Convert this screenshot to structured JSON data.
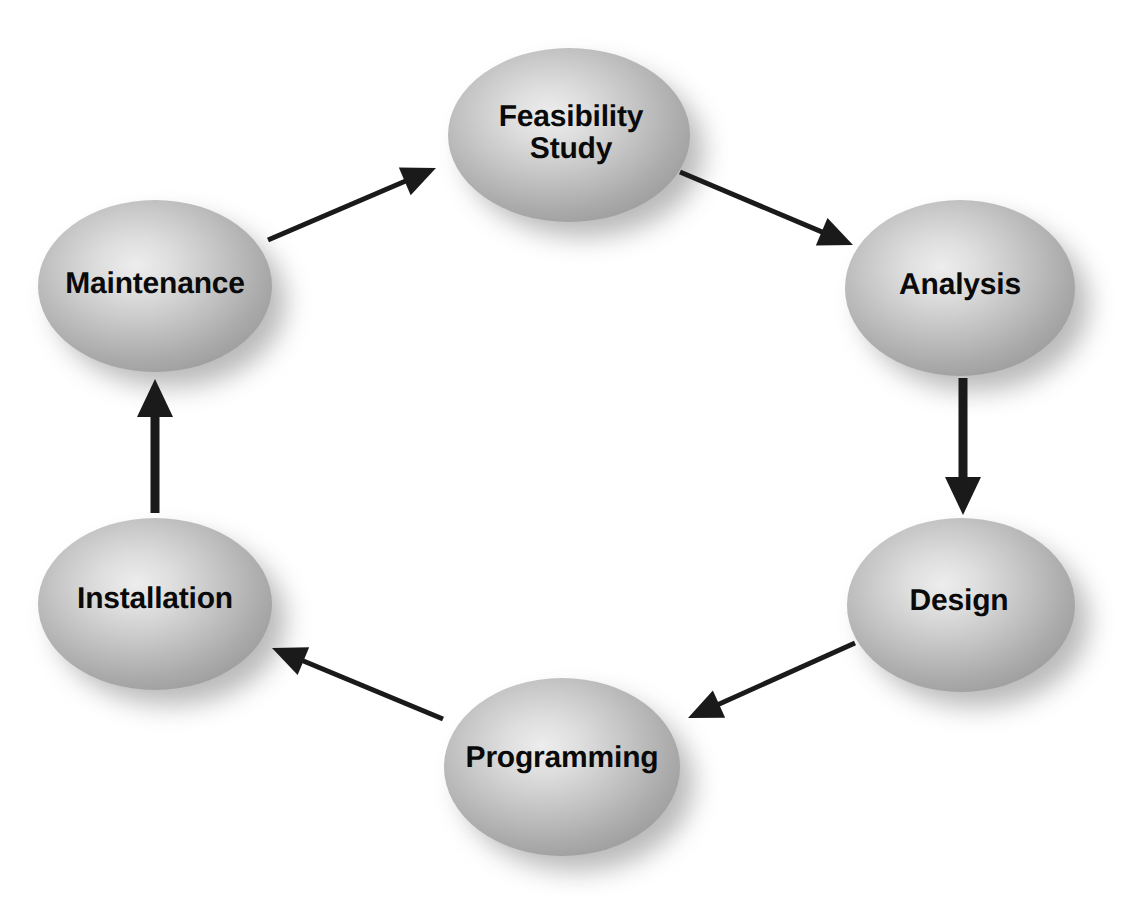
{
  "diagram": {
    "type": "cycle-flow-diagram",
    "background_color": "#ffffff",
    "node_fill_center": "#e9e9e9",
    "node_fill_mid": "#c2c2c2",
    "node_fill_edge": "#9a9a9a",
    "node_shadow_color": "#8f8f8f",
    "label_color": "#0a0a0a",
    "arrow_color": "#1a1a1a",
    "nodes": [
      {
        "id": "feasibility-study",
        "label": "Feasibility\nStudy",
        "cx": 569,
        "cy": 135,
        "rx": 121,
        "ry": 87,
        "font_size": 30,
        "label_dx": 2,
        "label_dy": -2
      },
      {
        "id": "analysis",
        "label": "Analysis",
        "cx": 960,
        "cy": 288,
        "rx": 115,
        "ry": 88,
        "font_size": 30,
        "label_dx": 0,
        "label_dy": -3
      },
      {
        "id": "design",
        "label": "Design",
        "cx": 961,
        "cy": 605,
        "rx": 114,
        "ry": 87,
        "font_size": 30,
        "label_dx": -2,
        "label_dy": -4
      },
      {
        "id": "programming",
        "label": "Programming",
        "cx": 562,
        "cy": 767,
        "rx": 118,
        "ry": 89,
        "font_size": 30,
        "label_dx": 0,
        "label_dy": -9
      },
      {
        "id": "installation",
        "label": "Installation",
        "cx": 155,
        "cy": 604,
        "rx": 117,
        "ry": 86,
        "font_size": 30,
        "label_dx": 0,
        "label_dy": -5
      },
      {
        "id": "maintenance",
        "label": "Maintenance",
        "cx": 155,
        "cy": 286,
        "rx": 117,
        "ry": 86,
        "font_size": 30,
        "label_dx": 0,
        "label_dy": -2
      }
    ],
    "arrows": [
      {
        "id": "maintenance-to-feasibility",
        "from": "maintenance",
        "to": "feasibility-study",
        "x1": 268,
        "y1": 240,
        "x2": 436,
        "y2": 168,
        "stroke_width": 5,
        "head_length": 34,
        "head_width": 30
      },
      {
        "id": "feasibility-to-analysis",
        "from": "feasibility-study",
        "to": "analysis",
        "x1": 680,
        "y1": 172,
        "x2": 853,
        "y2": 245,
        "stroke_width": 5,
        "head_length": 34,
        "head_width": 30
      },
      {
        "id": "analysis-to-design",
        "from": "analysis",
        "to": "design",
        "x1": 963,
        "y1": 378,
        "x2": 963,
        "y2": 515,
        "stroke_width": 9,
        "head_length": 38,
        "head_width": 36
      },
      {
        "id": "design-to-programming",
        "from": "design",
        "to": "programming",
        "x1": 855,
        "y1": 643,
        "x2": 688,
        "y2": 718,
        "stroke_width": 5,
        "head_length": 34,
        "head_width": 30
      },
      {
        "id": "programming-to-installation",
        "from": "programming",
        "to": "installation",
        "x1": 443,
        "y1": 719,
        "x2": 272,
        "y2": 648,
        "stroke_width": 5,
        "head_length": 34,
        "head_width": 30
      },
      {
        "id": "installation-to-maintenance",
        "from": "installation",
        "to": "maintenance",
        "x1": 155,
        "y1": 513,
        "x2": 155,
        "y2": 379,
        "stroke_width": 9,
        "head_length": 38,
        "head_width": 36
      }
    ]
  }
}
